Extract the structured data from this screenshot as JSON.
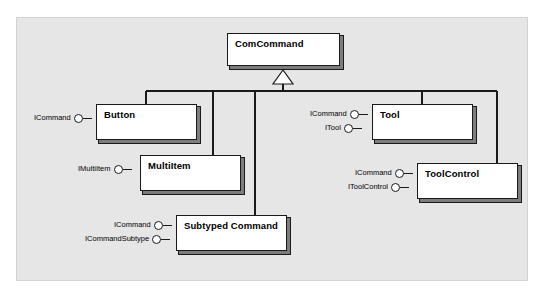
{
  "diagram": {
    "kind": "uml-component-diagram",
    "background_color": "#e6e6e6",
    "page_color": "#ffffff",
    "border_color": "#1a1a1a",
    "box_fill": "#ffffff",
    "shadow_color": "#7d7d7d",
    "base_class": {
      "name": "ComCommand",
      "x": 227,
      "y": 33,
      "w": 113,
      "h": 33
    },
    "classes": [
      {
        "id": "button",
        "name": "Button",
        "x": 96,
        "y": 104,
        "w": 101,
        "h": 36,
        "interfaces": [
          "ICommand"
        ]
      },
      {
        "id": "tool",
        "name": "Tool",
        "x": 372,
        "y": 104,
        "w": 101,
        "h": 36,
        "interfaces": [
          "ICommand",
          "ITool"
        ]
      },
      {
        "id": "multiitem",
        "name": "MultiItem",
        "x": 140,
        "y": 155,
        "w": 101,
        "h": 36,
        "interfaces": [
          "IMultiItem"
        ]
      },
      {
        "id": "toolcontrol",
        "name": "ToolControl",
        "x": 417,
        "y": 163,
        "w": 101,
        "h": 36,
        "interfaces": [
          "ICommand",
          "IToolControl"
        ]
      },
      {
        "id": "subtyped",
        "name": "Subtyped Command",
        "x": 176,
        "y": 215,
        "w": 111,
        "h": 36,
        "interfaces": [
          "ICommand",
          "ICommandSubtype"
        ]
      }
    ],
    "generalization": {
      "triangle_label": "generalization-triangle",
      "apex_x": 283,
      "apex_y": 70,
      "bus_y": 91
    }
  }
}
